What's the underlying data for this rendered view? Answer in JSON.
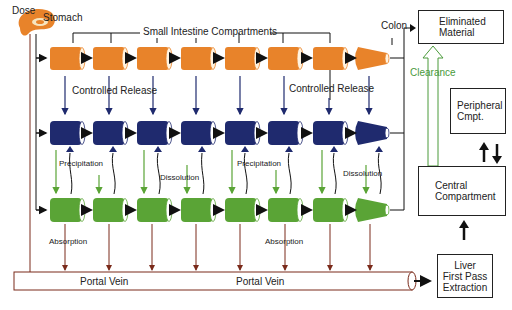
{
  "labels": {
    "dose": "Dose",
    "stomach": "Stomach",
    "small_intestine": "Small Intestine Compartments",
    "colon": "Colon",
    "controlled_release_1": "Controlled Release",
    "controlled_release_2": "Controlled Release",
    "precipitation_1": "Precipitation",
    "precipitation_2": "Precipitation",
    "dissolution_1": "Dissolution",
    "dissolution_2": "Dissolution",
    "absorption_1": "Absorption",
    "absorption_2": "Absorption",
    "portal_vein_1": "Portal Vein",
    "portal_vein_2": "Portal Vein",
    "clearance": "Clearance"
  },
  "boxes": {
    "eliminated": {
      "line1": "Eliminated",
      "line2": "Material"
    },
    "peripheral": {
      "line1": "Peripheral",
      "line2": "Cmpt."
    },
    "central": {
      "line1": "Central",
      "line2": "Compartment"
    },
    "liver": {
      "line1": "Liver",
      "line2": "First Pass",
      "line3": "Extraction"
    }
  },
  "colors": {
    "orange": "#e8832a",
    "navy": "#1f2a6e",
    "green": "#5aa436",
    "brown": "#7a2a1a",
    "clearance_green": "#4a9a3a"
  },
  "rows": [
    {
      "name": "release-row",
      "color": "#e8832a",
      "compartments": 8
    },
    {
      "name": "undissolved-row",
      "color": "#1f2a6e",
      "compartments": 8
    },
    {
      "name": "dissolved-row",
      "color": "#5aa436",
      "compartments": 8
    }
  ]
}
